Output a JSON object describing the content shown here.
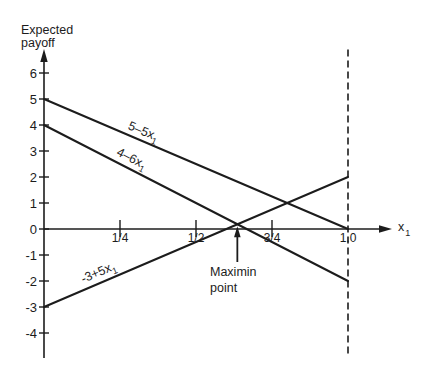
{
  "chart_data": {
    "type": "line",
    "title": "",
    "xlabel": "x1",
    "xlabel_main": "x",
    "xlabel_sub": "1",
    "ylabel": "Expected payoff",
    "ylabel_lines": [
      "Expected",
      "payoff"
    ],
    "xlim": [
      0,
      1
    ],
    "ylim": [
      -4,
      6
    ],
    "grid": false,
    "legend": "none (series labeled inline along lines)",
    "x_ticks": [
      {
        "value": 0.25,
        "label": "1/4"
      },
      {
        "value": 0.5,
        "label": "1/2"
      },
      {
        "value": 0.75,
        "label": "3/4"
      },
      {
        "value": 1.0,
        "label": "1.0"
      }
    ],
    "y_ticks": [
      {
        "value": 6,
        "label": "6"
      },
      {
        "value": 5,
        "label": "5"
      },
      {
        "value": 4,
        "label": "4"
      },
      {
        "value": 3,
        "label": "3"
      },
      {
        "value": 2,
        "label": "2"
      },
      {
        "value": 1,
        "label": "1"
      },
      {
        "value": 0,
        "label": "0"
      },
      {
        "value": -1,
        "label": "-1"
      },
      {
        "value": -2,
        "label": "-2"
      },
      {
        "value": -3,
        "label": "-3"
      },
      {
        "value": -4,
        "label": "-4"
      }
    ],
    "series": [
      {
        "name": "5 - 5x1",
        "label_main": "5–5x",
        "label_sub": "1",
        "intercept": 5,
        "slope": -5,
        "x": [
          0,
          1
        ],
        "y": [
          5,
          0
        ]
      },
      {
        "name": "4 - 6x1",
        "label_main": "4–6x",
        "label_sub": "1",
        "intercept": 4,
        "slope": -6,
        "x": [
          0,
          1
        ],
        "y": [
          4,
          -2
        ]
      },
      {
        "name": "-3 + 5x1",
        "label_main": "-3+5x",
        "label_sub": "1",
        "intercept": -3,
        "slope": 5,
        "x": [
          0,
          1
        ],
        "y": [
          -3,
          2
        ]
      }
    ],
    "reference_lines": [
      {
        "orientation": "vertical",
        "x": 1.0,
        "style": "dashed",
        "y_range": [
          -4.9,
          6.9
        ]
      }
    ],
    "annotations": [
      {
        "text": "Maximin point",
        "text_lines": [
          "Maximin",
          "point"
        ],
        "x": 0.636,
        "y": 0.182,
        "arrow": true
      }
    ]
  }
}
